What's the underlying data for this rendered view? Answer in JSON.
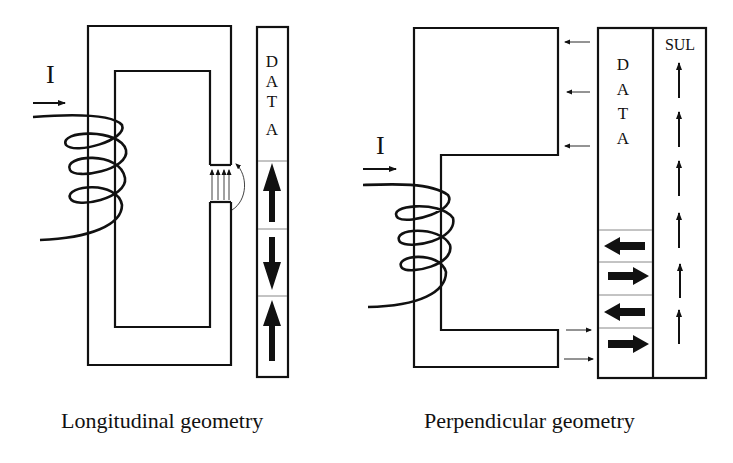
{
  "left_diagram": {
    "caption": "Longitudinal geometry",
    "current_label": "I",
    "media_label": [
      "D",
      "A",
      "T",
      "A"
    ],
    "bits": [
      "up",
      "down",
      "up"
    ]
  },
  "right_diagram": {
    "caption": "Perpendicular geometry",
    "current_label": "I",
    "media_label": [
      "D",
      "A",
      "T",
      "A"
    ],
    "underlayer_label": "SUL",
    "bits": [
      "left",
      "right",
      "left",
      "right"
    ]
  },
  "colors": {
    "stroke": "#111111",
    "background": "#ffffff",
    "divider": "#888888"
  }
}
